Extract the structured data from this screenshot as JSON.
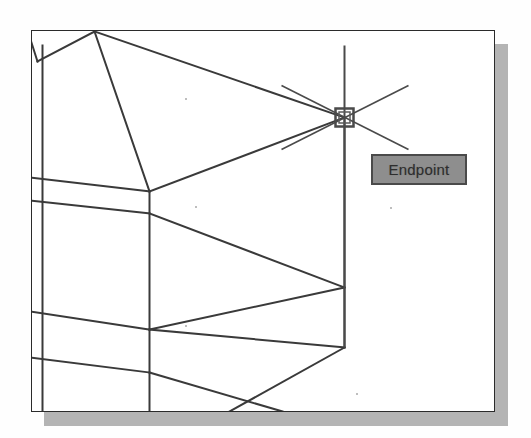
{
  "app": {
    "name": "CAD Drawing Viewport",
    "description": "Isometric wireframe drawing with object snap"
  },
  "canvas": {
    "frame_label": "drawing-viewport",
    "background_color": "#ffffff",
    "border_color": "#2b2b2b",
    "shadow_color": "#b4b4b4",
    "line_color": "#3a3a3a",
    "frame": {
      "x": 31,
      "y": 30,
      "width": 464,
      "height": 382
    }
  },
  "osnap": {
    "tooltip_label": "Endpoint",
    "tooltip_bg_color": "#8e8e8e",
    "tooltip_border_color": "#4a4a4a",
    "tooltip_text_color": "#2e2e2e",
    "marker_type": "square",
    "marker_label": "endpoint-marker",
    "marker_position": {
      "x": 345,
      "y": 118
    },
    "marker_size": 18
  },
  "crosshair": {
    "label": "isometric-crosshair",
    "center": {
      "x": 345,
      "y": 118
    },
    "vertical_top": {
      "x": 345,
      "y": 46
    },
    "vertical_bottom": {
      "x": 345,
      "y": 348
    },
    "diagonal_1_start": {
      "x": 282,
      "y": 86
    },
    "diagonal_1_end": {
      "x": 409,
      "y": 150
    },
    "diagonal_2_start": {
      "x": 282,
      "y": 150
    },
    "diagonal_2_end": {
      "x": 409,
      "y": 86
    },
    "color": "#4a4a4a"
  },
  "geometry": {
    "label": "isometric-wireframe",
    "stroke_color": "#3a3a3a",
    "stroke_width": 2,
    "polylines": [
      {
        "name": "top-face-left-ridge",
        "points": "38,62 95,32 150,192"
      },
      {
        "name": "top-face-ridge-to-apex",
        "points": "95,32 345,118"
      },
      {
        "name": "top-face-front-edge",
        "points": "150,192 345,118"
      },
      {
        "name": "left-wall-upper-edge",
        "points": "31,40 38,62"
      },
      {
        "name": "left-vertical-outer",
        "points": "31,40 31,412"
      },
      {
        "name": "left-vertical-inner",
        "points": "43,46 43,412"
      },
      {
        "name": "left-band-1-top",
        "points": "31,178 150,192"
      },
      {
        "name": "left-band-1-bottom",
        "points": "31,201 150,214"
      },
      {
        "name": "front-vertical-mid",
        "points": "150,192 150,412"
      },
      {
        "name": "mid-face-diagonal",
        "points": "150,214 345,288"
      },
      {
        "name": "right-vertical-edge",
        "points": "345,118 345,348"
      },
      {
        "name": "lower-diagonal-a",
        "points": "345,288 150,330"
      },
      {
        "name": "left-band-2-top",
        "points": "31,312 150,330"
      },
      {
        "name": "lower-diagonal-b",
        "points": "150,330 345,348"
      },
      {
        "name": "left-band-3-top",
        "points": "31,358 150,373"
      },
      {
        "name": "bottom-diagonal",
        "points": "150,373 283,412"
      },
      {
        "name": "bottom-right-diagonal",
        "points": "345,348 230,412"
      }
    ]
  },
  "artifacts": {
    "label": "scan-specks",
    "dots": [
      {
        "x": 185,
        "y": 98
      },
      {
        "x": 195,
        "y": 206
      },
      {
        "x": 185,
        "y": 325
      },
      {
        "x": 356,
        "y": 393
      },
      {
        "x": 390,
        "y": 207
      }
    ]
  }
}
